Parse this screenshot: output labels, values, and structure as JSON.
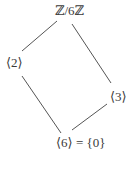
{
  "diagram": {
    "type": "subgroup-lattice",
    "nodes": [
      {
        "id": "top",
        "label": "ℤ/6ℤ"
      },
      {
        "id": "left",
        "label": "⟨2⟩"
      },
      {
        "id": "right",
        "label": "⟨3⟩"
      },
      {
        "id": "bottom",
        "label": "⟨6⟩ = {0}"
      }
    ],
    "edges": [
      {
        "from": "top",
        "to": "left"
      },
      {
        "from": "top",
        "to": "right"
      },
      {
        "from": "left",
        "to": "bottom"
      },
      {
        "from": "right",
        "to": "bottom"
      }
    ],
    "colors": {
      "text": "#3a3a3a",
      "edge": "#555555",
      "background": "#ffffff"
    }
  }
}
